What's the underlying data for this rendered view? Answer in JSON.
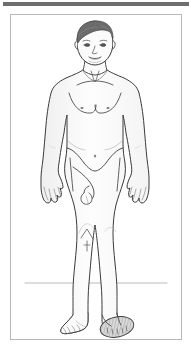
{
  "page": {
    "width": 193,
    "height": 353,
    "background_color": "#ffffff"
  },
  "header_bar": {
    "name": "top-rule",
    "color": "#6e6e6e",
    "height": 4
  },
  "frame": {
    "name": "illustration-frame",
    "border_color": "#b8b8b8",
    "background_color": "#ffffff"
  },
  "illustration": {
    "title": "Standing male figure, anterior view",
    "type": "anatomical-line-drawing",
    "view": "anterior",
    "subject": "adult male",
    "pose": "standing, arms at sides",
    "line_color": "#3a3a3a",
    "skin_fill": "#fdfdfd",
    "shadow_fill": "#f0f0f0",
    "hair_color": "#6b6b6b",
    "highlight_color": "#9a9a9a",
    "ground_line_color": "#9a9a9a",
    "parts": [
      {
        "name": "hair",
        "label": "Hair",
        "color": "#6b6b6b"
      },
      {
        "name": "head",
        "label": "Head"
      },
      {
        "name": "face",
        "label": "Face"
      },
      {
        "name": "eyes",
        "label": "Eyes"
      },
      {
        "name": "nose",
        "label": "Nose"
      },
      {
        "name": "mouth",
        "label": "Mouth"
      },
      {
        "name": "ears",
        "label": "Ears"
      },
      {
        "name": "neck",
        "label": "Neck"
      },
      {
        "name": "clavicles",
        "label": "Clavicles"
      },
      {
        "name": "shoulders",
        "label": "Shoulders"
      },
      {
        "name": "chest",
        "label": "Chest"
      },
      {
        "name": "nipples",
        "label": "Nipples"
      },
      {
        "name": "abdomen",
        "label": "Abdomen"
      },
      {
        "name": "navel",
        "label": "Navel"
      },
      {
        "name": "left-arm",
        "label": "Left arm"
      },
      {
        "name": "right-arm",
        "label": "Right arm"
      },
      {
        "name": "left-hand",
        "label": "Left hand"
      },
      {
        "name": "right-hand",
        "label": "Right hand"
      },
      {
        "name": "pelvis",
        "label": "Pelvis"
      },
      {
        "name": "genitals",
        "label": "Genitals"
      },
      {
        "name": "left-thigh",
        "label": "Left thigh"
      },
      {
        "name": "right-thigh",
        "label": "Right thigh"
      },
      {
        "name": "left-knee",
        "label": "Left knee"
      },
      {
        "name": "right-knee",
        "label": "Right knee"
      },
      {
        "name": "left-shin",
        "label": "Left shin"
      },
      {
        "name": "right-shin",
        "label": "Right shin"
      },
      {
        "name": "left-foot",
        "label": "Left foot"
      },
      {
        "name": "right-foot",
        "label": "Right foot",
        "highlighted": true
      }
    ],
    "ground_line": {
      "name": "ground-line",
      "present": true
    },
    "marking": {
      "name": "right-foot-highlight",
      "description": "Shaded hatched marking on right foot dorsum",
      "color": "#8a8a8a"
    }
  }
}
